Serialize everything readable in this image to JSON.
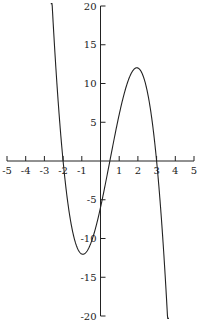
{
  "chart_data": {
    "type": "line",
    "title": "",
    "xlabel": "",
    "ylabel": "",
    "xlim": [
      -5,
      5
    ],
    "ylim": [
      -20,
      20
    ],
    "grid": false,
    "legend": null,
    "x_ticks": [
      -5,
      -4,
      -3,
      -2,
      -1,
      1,
      2,
      3,
      4,
      5
    ],
    "y_ticks": [
      -20,
      -15,
      -10,
      -5,
      5,
      10,
      15,
      20
    ],
    "series": [
      {
        "name": "f(x) = -2(x+2)(x-0.5)(x-3)",
        "function": "-2*(x+2)*(x-0.5)*(x-3)",
        "x_range": [
          -2.66,
          3.66
        ],
        "key_points": [
          {
            "x": -2,
            "y": 0
          },
          {
            "x": -1,
            "y": -12
          },
          {
            "x": 0,
            "y": -6
          },
          {
            "x": 0.5,
            "y": 0
          },
          {
            "x": 2,
            "y": 12
          },
          {
            "x": 3,
            "y": 0
          }
        ]
      }
    ],
    "color": "#222222"
  }
}
